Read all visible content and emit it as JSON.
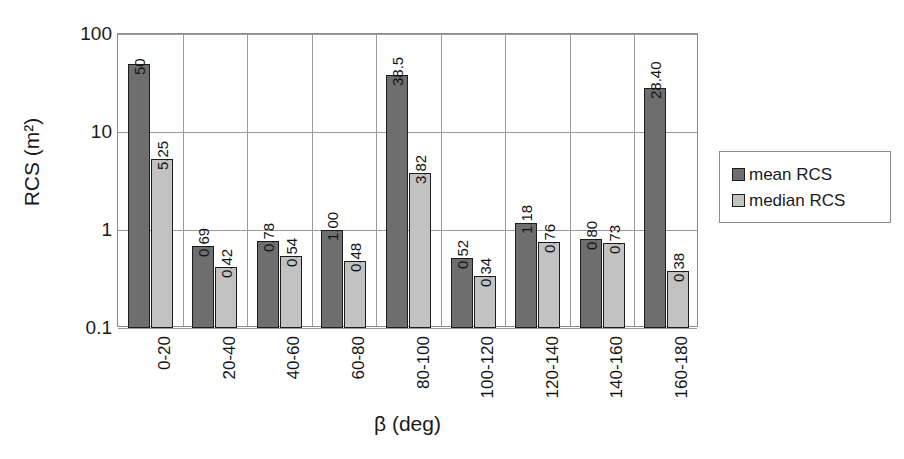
{
  "chart_data": {
    "type": "bar",
    "title": "",
    "xlabel": "β (deg)",
    "ylabel": "RCS (m²)",
    "yscale": "log",
    "ylim": [
      0.1,
      100
    ],
    "ytick_labels": [
      "100",
      "10",
      "1",
      "0.1"
    ],
    "ytick_values": [
      100,
      10,
      1,
      0.1
    ],
    "grid": true,
    "legend_position": "right",
    "categories": [
      "0-20",
      "20-40",
      "40-60",
      "60-80",
      "80-100",
      "100-120",
      "120-140",
      "140-160",
      "160-180"
    ],
    "series": [
      {
        "name": "mean RCS",
        "color": "#6e6e6e",
        "values": [
          50,
          0.69,
          0.78,
          1.0,
          38.5,
          0.52,
          1.18,
          0.8,
          28.4
        ],
        "labels": [
          "50",
          "0.69",
          "0.78",
          "1.00",
          "38.5",
          "0.52",
          "1.18",
          "0.80",
          "28.40"
        ]
      },
      {
        "name": "median RCS",
        "color": "#c2c2c2",
        "values": [
          5.25,
          0.42,
          0.54,
          0.48,
          3.82,
          0.34,
          0.76,
          0.73,
          0.38
        ],
        "labels": [
          "5.25",
          "0.42",
          "0.54",
          "0.48",
          "3.82",
          "0.34",
          "0.76",
          "0.73",
          "0.38"
        ]
      }
    ]
  },
  "legend": {
    "items": [
      {
        "label": "mean RCS",
        "color": "#6e6e6e"
      },
      {
        "label": "median RCS",
        "color": "#c2c2c2"
      }
    ]
  },
  "axes": {
    "y_title": "RCS (m²)",
    "x_title": "β (deg)"
  }
}
